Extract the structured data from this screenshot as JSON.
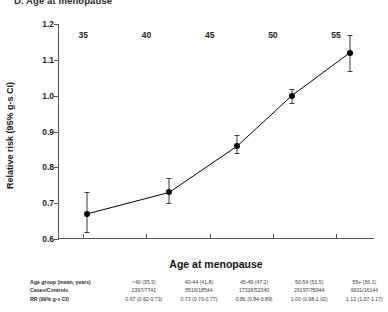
{
  "panel": {
    "title": "D. Age at menopause"
  },
  "chart_data": {
    "type": "line",
    "title": "D. Age at menopause",
    "xlabel": "Age at menopause",
    "ylabel": "Relative risk (95% g-s CI)",
    "xlim": [
      33,
      58
    ],
    "ylim": [
      0.6,
      1.2
    ],
    "xticks": [
      35,
      40,
      45,
      50,
      55
    ],
    "yticks": [
      "0.6",
      "0.7",
      "0.8",
      "0.9",
      "1.0",
      "1.1",
      "1.2"
    ],
    "grid": false,
    "legend": "none",
    "series": [
      {
        "name": "Relative risk",
        "marker": "filled-circle",
        "color": "#000000",
        "x": [
          35.3,
          41.8,
          47.2,
          51.5,
          56.1
        ],
        "values": [
          0.67,
          0.73,
          0.86,
          1.0,
          1.12
        ],
        "ci_low": [
          0.62,
          0.7,
          0.84,
          0.98,
          1.07
        ],
        "ci_high": [
          0.73,
          0.77,
          0.89,
          1.02,
          1.17
        ]
      }
    ],
    "table": {
      "row_labels": [
        "Age group (mean, years)",
        "Cases/Controls",
        "RR (99% g-s CI)"
      ],
      "columns": [
        {
          "age_group": "<40 (35.3)",
          "cases_controls": "2397/7741",
          "rr": "0.67 (0.62-0.73)"
        },
        {
          "age_group": "40-44 (41.8)",
          "cases_controls": "5516/18544",
          "rr": "0.73 (0.70-0.77)"
        },
        {
          "age_group": "45-49 (47.2)",
          "cases_controls": "17336/52040",
          "rr": "0.86 (0.84-0.89)"
        },
        {
          "age_group": "50-54 (51.5)",
          "cases_controls": "26197/75944",
          "rr": "1.00 (0.98-1.02)"
        },
        {
          "age_group": "55+ (56.1)",
          "cases_controls": "6601/16144",
          "rr": "1.12 (1.07-1.17)"
        }
      ]
    }
  }
}
